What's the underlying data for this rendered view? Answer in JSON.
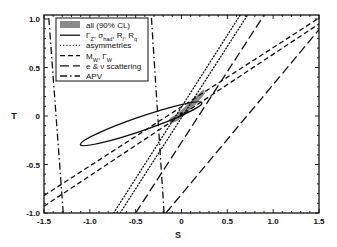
{
  "chart_data": {
    "type": "line",
    "title": "",
    "xlabel": "S",
    "ylabel": "T",
    "xlim": [
      -1.5,
      1.5
    ],
    "ylim": [
      -1.0,
      1.05
    ],
    "xticks": [
      -1.5,
      -1.0,
      -0.5,
      0,
      0.5,
      1.0,
      1.5
    ],
    "xtick_labels": [
      "-1.5",
      "-1.0",
      "-0.5",
      "0",
      "0.5",
      "1.0",
      "1.5"
    ],
    "yticks": [
      -1.0,
      -0.5,
      0,
      0.5,
      1.0
    ],
    "ytick_labels": [
      "-1.0",
      "-0.5",
      "0",
      "0.5",
      "1.0"
    ],
    "grid": false,
    "legend_position": "top-left",
    "legend": [
      {
        "key": "all",
        "label": "all (90% CL)",
        "style": "filled",
        "color": "#8a8a8a"
      },
      {
        "key": "gammaz",
        "label": "Γ_Z, σ_had, R_l, R_q",
        "style": "solid",
        "color": "#111111"
      },
      {
        "key": "asym",
        "label": "asymmetries",
        "style": "dotted",
        "color": "#111111"
      },
      {
        "key": "mw",
        "label": "M_W, Γ_W",
        "style": "short-dash",
        "color": "#111111"
      },
      {
        "key": "enu",
        "label": "e & ν scattering",
        "style": "long-dash",
        "color": "#111111"
      },
      {
        "key": "apv",
        "label": "APV",
        "style": "dash-dot",
        "color": "#111111"
      }
    ],
    "series": [
      {
        "name": "all (90% CL)",
        "kind": "region",
        "points": [
          [
            -0.13,
            -0.03
          ],
          [
            -0.06,
            0.01
          ],
          [
            0.05,
            0.1
          ],
          [
            0.16,
            0.2
          ],
          [
            0.24,
            0.27
          ],
          [
            0.25,
            0.23
          ],
          [
            0.14,
            0.11
          ],
          [
            0.04,
            0.02
          ],
          [
            -0.05,
            -0.05
          ],
          [
            -0.12,
            -0.07
          ]
        ]
      },
      {
        "name": "best fit",
        "kind": "point",
        "points": [
          [
            0.0,
            0.02
          ]
        ]
      },
      {
        "name": "Γ_Z, σ_had, R_l, R_q",
        "kind": "ellipse",
        "center": [
          -0.44,
          -0.08
        ],
        "semi_major": 0.7,
        "semi_minor": 0.055,
        "angle_deg": 19
      },
      {
        "name": "asymmetries",
        "kind": "band-lines",
        "lines": [
          [
            [
              -0.74,
              -1.0
            ],
            [
              0.64,
              1.04
            ]
          ],
          [
            [
              -0.67,
              -1.0
            ],
            [
              0.72,
              1.04
            ]
          ]
        ]
      },
      {
        "name": "M_W, Γ_W",
        "kind": "band-lines",
        "lines": [
          [
            [
              -1.5,
              -0.82
            ],
            [
              1.5,
              1.01
            ]
          ],
          [
            [
              -1.5,
              -0.93
            ],
            [
              1.5,
              0.95
            ]
          ]
        ]
      },
      {
        "name": "e & ν scattering",
        "kind": "band-lines",
        "lines": [
          [
            [
              -0.5,
              -1.0
            ],
            [
              0.9,
              1.04
            ]
          ],
          [
            [
              -0.17,
              -1.0
            ],
            [
              1.5,
              0.89
            ]
          ]
        ]
      },
      {
        "name": "APV",
        "kind": "band-lines",
        "lines": [
          [
            [
              -1.29,
              -1.0
            ],
            [
              -1.45,
              1.04
            ]
          ],
          [
            [
              -0.19,
              -1.0
            ],
            [
              -0.33,
              1.04
            ]
          ]
        ]
      }
    ]
  }
}
